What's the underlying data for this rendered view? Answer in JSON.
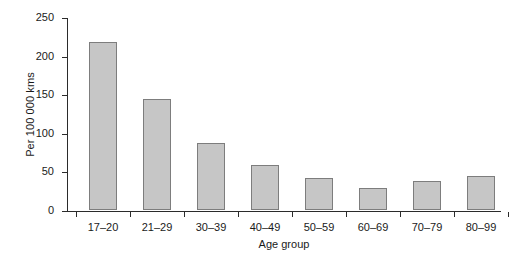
{
  "chart_data": {
    "type": "bar",
    "title": "",
    "subtitle": "",
    "xlabel": "Age group",
    "ylabel": "Per 100 000 kms",
    "categories": [
      "17–20",
      "21–29",
      "30–39",
      "40–49",
      "50–59",
      "60–69",
      "70–79",
      "80–99"
    ],
    "values": [
      218,
      144,
      87,
      58,
      41,
      28,
      37,
      44
    ],
    "ylim": [
      0,
      250
    ],
    "ytick_labels": [
      "0",
      "50",
      "100",
      "150",
      "200",
      "250"
    ],
    "ytick_values": [
      0,
      50,
      100,
      150,
      200,
      250
    ],
    "grid": false,
    "legend": null,
    "annotations": [],
    "colors": {
      "bar_fill": "#c6c6c6",
      "bar_edge": "#7d7d7d",
      "axis": "#2b2b2b",
      "text": "#1a1a1a",
      "background": "#ffffff"
    }
  }
}
